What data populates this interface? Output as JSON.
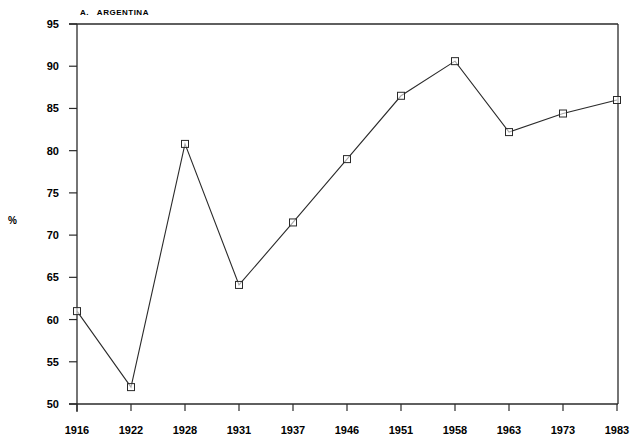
{
  "chart_data": {
    "type": "line",
    "title": "A.   ARGENTINA",
    "xlabel": "",
    "ylabel": "%",
    "categories": [
      "1916",
      "1922",
      "1928",
      "1931",
      "1937",
      "1946",
      "1951",
      "1958",
      "1963",
      "1973",
      "1983"
    ],
    "series": [
      {
        "name": "Argentina",
        "marker": "square",
        "values": [
          61,
          52,
          80.8,
          64.1,
          71.5,
          79,
          86.5,
          90.6,
          82.2,
          84.4,
          86
        ]
      }
    ],
    "ylim": [
      50,
      95
    ],
    "yticks": [
      50,
      55,
      60,
      65,
      70,
      75,
      80,
      85,
      90,
      95
    ],
    "grid": false,
    "legend": "none",
    "colors": {
      "line": "#2a2a2a",
      "axis": "#2a2a2a",
      "background": "#ffffff"
    }
  }
}
